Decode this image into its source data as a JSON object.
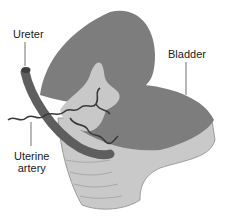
{
  "figure": {
    "title": "",
    "labels": {
      "ureter": "Ureter",
      "bladder": "Bladder",
      "uterine_line1": "Uterine",
      "uterine_line2": "artery"
    },
    "colors": {
      "bladder": "#7d7d7d",
      "ureter": "#5e5e5e",
      "cervix": "#c9c9c9",
      "folds": "#d8d8d8",
      "outline": "#555555",
      "text": "#1a1a1a"
    }
  }
}
